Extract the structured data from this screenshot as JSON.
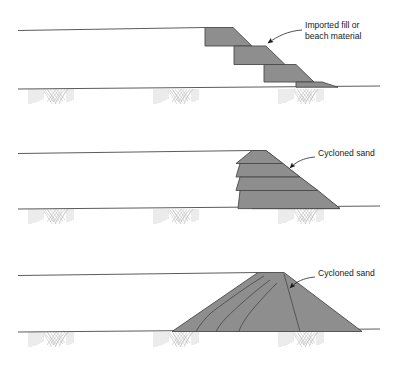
{
  "figure": {
    "background_color": "#ffffff",
    "fill_color": "#8e8e8e",
    "line_color": "#4a4a4a",
    "hatch_color": "#bdbdbd",
    "text_color": "#1a1a1a",
    "width": 397,
    "height": 369
  },
  "panels": [
    {
      "id": "panel-downstream-raise",
      "index": 1,
      "label": {
        "line1": "Imported fill or",
        "line2": "beach material",
        "x": 305,
        "y": 29
      },
      "ground_line_y": 88,
      "upper_surface_left_y": 30,
      "upper_surface_right_y": 27,
      "stage_count": 4,
      "description": "Four stepped trapezoidal lifts descending downstream"
    },
    {
      "id": "panel-centreline-raise",
      "index": 2,
      "label": {
        "line1": "Cycloned sand",
        "line2": "",
        "x": 318,
        "y": 156
      },
      "ground_line_y": 208,
      "upper_surface_left_y": 153,
      "upper_surface_right_y": 150,
      "stage_count": 4,
      "description": "Four stacked wedge layers with stepped upstream face"
    },
    {
      "id": "panel-upstream-raise",
      "index": 3,
      "label": {
        "line1": "Cycloned sand",
        "line2": "",
        "x": 318,
        "y": 276
      },
      "ground_line_y": 331,
      "upper_surface_left_y": 275,
      "upper_surface_right_y": 272,
      "stage_count": 4,
      "description": "Large symmetric embankment with internal stage boundaries"
    }
  ],
  "hatch_clusters": [
    {
      "panel": 1,
      "cx": 50,
      "y": 88,
      "w": 46,
      "h": 17
    },
    {
      "panel": 1,
      "cx": 175,
      "y": 88,
      "w": 46,
      "h": 17
    },
    {
      "panel": 1,
      "cx": 300,
      "y": 88,
      "w": 46,
      "h": 17
    },
    {
      "panel": 2,
      "cx": 50,
      "y": 208,
      "w": 46,
      "h": 17
    },
    {
      "panel": 2,
      "cx": 175,
      "y": 208,
      "w": 46,
      "h": 17
    },
    {
      "panel": 2,
      "cx": 300,
      "y": 208,
      "w": 46,
      "h": 17
    },
    {
      "panel": 3,
      "cx": 50,
      "y": 331,
      "w": 46,
      "h": 17
    },
    {
      "panel": 3,
      "cx": 175,
      "y": 331,
      "w": 46,
      "h": 17
    },
    {
      "panel": 3,
      "cx": 300,
      "y": 331,
      "w": 46,
      "h": 17
    }
  ]
}
